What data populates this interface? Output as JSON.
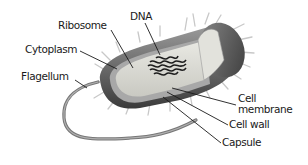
{
  "diagram": {
    "labels": {
      "ribosome": "Ribosome",
      "dna": "DNA",
      "cytoplasm": "Cytoplasm",
      "flagellum": "Flagellum",
      "cell_membrane_line1": "Cell",
      "cell_membrane_line2": "membrane",
      "cell_wall": "Cell wall",
      "capsule": "Capsule"
    },
    "colors": {
      "capsule_fill": "#6e6e6e",
      "cell_wall_fill": "#9a9a9a",
      "cytoplasm_fill": "#d9d9d2",
      "dna_fill": "#1e1e1e",
      "leader_line": "#1a1a1a",
      "pili": "#cfcfcf"
    }
  }
}
